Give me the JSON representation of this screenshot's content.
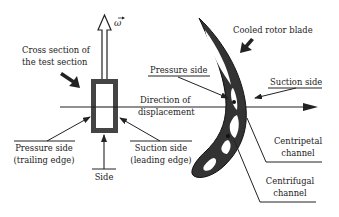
{
  "diagram": {
    "labels": {
      "omega": "ω",
      "cross_section_line1": "Cross section of",
      "cross_section_line2": "the test section",
      "pressure_side_blade": "Pressure side",
      "direction_line1": "Direction of",
      "direction_line2": "displacement",
      "pressure_side_te_line1": "Pressure side",
      "pressure_side_te_line2": "(trailing edge)",
      "suction_side_le_line1": "Suction side",
      "suction_side_le_line2": "(leading edge)",
      "side": "Side",
      "cooled_rotor_blade": "Cooled rotor blade",
      "suction_side_blade": "Suction side",
      "centripetal_line1": "Centripetal",
      "centripetal_line2": "channel",
      "centrifugal_line1": "Centrifugal",
      "centrifugal_line2": "channel"
    },
    "colors": {
      "ink": "#222222",
      "blade_fill": "#333333",
      "section_frame": "#444444"
    }
  }
}
